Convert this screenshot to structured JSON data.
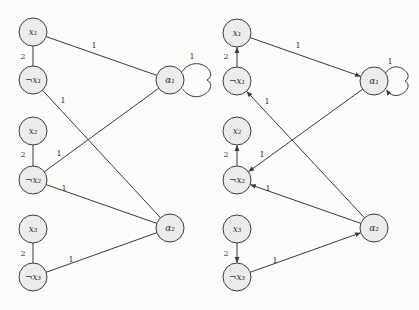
{
  "colors": {
    "node_fill": "#ececec",
    "stroke": "#3a3a3a",
    "background": "#fbfbfa"
  },
  "graphs": [
    {
      "name": "undirected-graph",
      "directed": false,
      "offset": [
        0,
        0
      ],
      "nodes": [
        {
          "id": "x1",
          "label": "x₁",
          "x": 33,
          "y": 32
        },
        {
          "id": "nx1",
          "label": "¬x₁",
          "x": 33,
          "y": 80
        },
        {
          "id": "x2",
          "label": "x₂",
          "x": 33,
          "y": 131
        },
        {
          "id": "nx2",
          "label": "¬x₂",
          "x": 33,
          "y": 180
        },
        {
          "id": "x3",
          "label": "x₃",
          "x": 33,
          "y": 229
        },
        {
          "id": "nx3",
          "label": "¬x₃",
          "x": 33,
          "y": 277
        },
        {
          "id": "a1",
          "label": "α₁",
          "x": 170,
          "y": 80
        },
        {
          "id": "a2",
          "label": "α₂",
          "x": 170,
          "y": 228
        }
      ],
      "edges": [
        {
          "from": "x1",
          "to": "nx1",
          "label": "2",
          "lx": 23,
          "ly": 59
        },
        {
          "from": "x1",
          "to": "a1",
          "label": "1",
          "lx": 94,
          "ly": 48
        },
        {
          "from": "nx1",
          "to": "a2",
          "label": "1",
          "lx": 63,
          "ly": 103
        },
        {
          "from": "x2",
          "to": "nx2",
          "label": "2",
          "lx": 23,
          "ly": 157
        },
        {
          "from": "a1",
          "to": "nx2",
          "label": "1",
          "lx": 59,
          "ly": 156
        },
        {
          "from": "nx2",
          "to": "a2",
          "label": "1",
          "lx": 64,
          "ly": 191
        },
        {
          "from": "x3",
          "to": "nx3",
          "label": "2",
          "lx": 23,
          "ly": 256
        },
        {
          "from": "nx3",
          "to": "a2",
          "label": "1",
          "lx": 71,
          "ly": 262
        }
      ],
      "loop": {
        "node": "a1",
        "label": "1",
        "lx": 192,
        "ly": 59,
        "size": 37
      }
    },
    {
      "name": "directed-graph",
      "directed": true,
      "offset": [
        0,
        0
      ],
      "nodes": [
        {
          "id": "x1",
          "label": "x₁",
          "x": 237,
          "y": 33
        },
        {
          "id": "nx1",
          "label": "¬x₁",
          "x": 237,
          "y": 81
        },
        {
          "id": "x2",
          "label": "x₂",
          "x": 237,
          "y": 131
        },
        {
          "id": "nx2",
          "label": "¬x₂",
          "x": 237,
          "y": 180
        },
        {
          "id": "x3",
          "label": "x₃",
          "x": 237,
          "y": 229
        },
        {
          "id": "nx3",
          "label": "¬x₃",
          "x": 237,
          "y": 277
        },
        {
          "id": "a1",
          "label": "α₁",
          "x": 374,
          "y": 81
        },
        {
          "id": "a2",
          "label": "α₂",
          "x": 374,
          "y": 228
        }
      ],
      "edges": [
        {
          "from": "nx1",
          "to": "x1",
          "label": "2",
          "lx": 226,
          "ly": 59
        },
        {
          "from": "x1",
          "to": "a1",
          "label": "1",
          "lx": 298,
          "ly": 48
        },
        {
          "from": "a2",
          "to": "nx1",
          "label": "1",
          "lx": 267,
          "ly": 104
        },
        {
          "from": "nx2",
          "to": "x2",
          "label": "2",
          "lx": 226,
          "ly": 157
        },
        {
          "from": "a1",
          "to": "nx2",
          "label": "1",
          "lx": 262,
          "ly": 157
        },
        {
          "from": "a2",
          "to": "nx2",
          "label": "1",
          "lx": 268,
          "ly": 191
        },
        {
          "from": "x3",
          "to": "nx3",
          "label": "2",
          "lx": 226,
          "ly": 256
        },
        {
          "from": "nx3",
          "to": "a2",
          "label": "1",
          "lx": 275,
          "ly": 263
        }
      ],
      "loop": {
        "node": "a1",
        "label": "1",
        "lx": 390,
        "ly": 64,
        "size": 31
      }
    }
  ]
}
